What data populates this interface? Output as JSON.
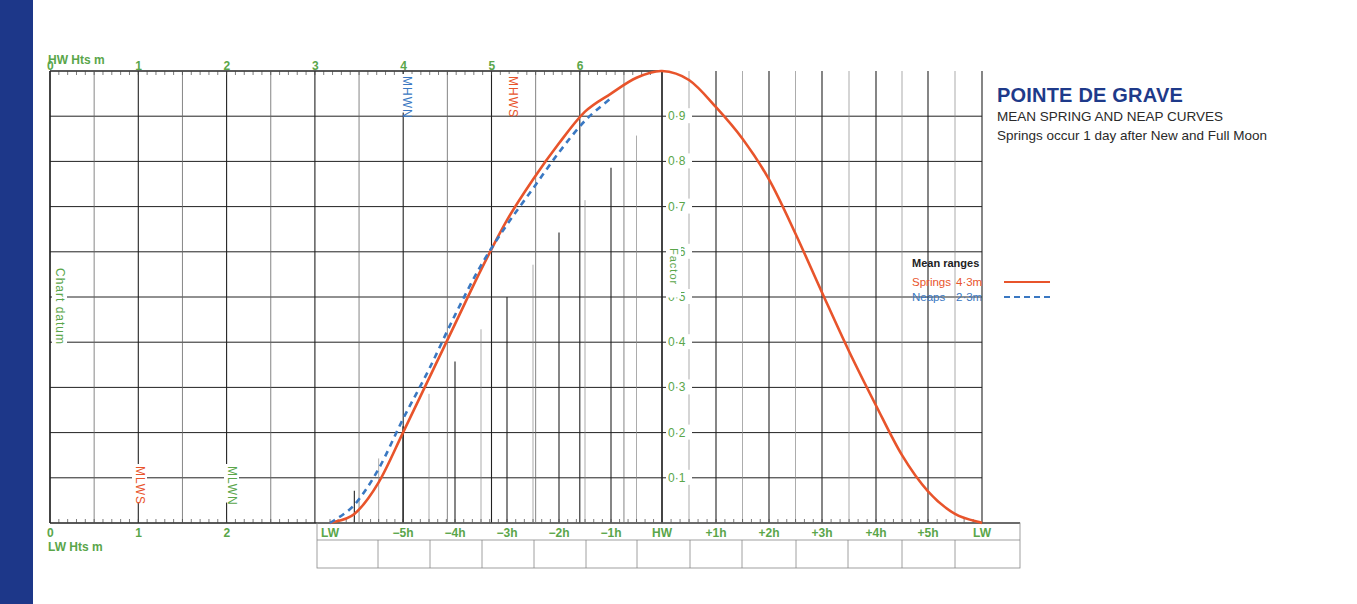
{
  "title": "POINTE DE GRAVE",
  "subtitle_lines": [
    "MEAN SPRING AND NEAP CURVES",
    "Springs occur 1 day after New and Full Moon"
  ],
  "legend": {
    "title": "Mean ranges",
    "items": [
      {
        "name": "Springs",
        "range": "4·3m",
        "style": "solid",
        "color": "#e8542b"
      },
      {
        "name": "Neaps",
        "range": "2·3m",
        "style": "dashed",
        "color": "#3a78c2"
      }
    ]
  },
  "axes": {
    "hw_heights_label": "HW Hts m",
    "lw_heights_label": "LW Hts m",
    "hw_height_ticks": [
      "0",
      "1",
      "2",
      "3",
      "4",
      "5",
      "6"
    ],
    "lw_height_ticks": [
      "0",
      "1",
      "2"
    ],
    "chart_datum_label": "Chart datum",
    "factor_label": "Factor",
    "factor_ticks": [
      "0·1",
      "0·2",
      "0·3",
      "0·4",
      "0·5",
      "0·6",
      "0·7",
      "0·8",
      "0·9"
    ],
    "time_ticks": [
      "LW",
      "−5h",
      "−4h",
      "−3h",
      "−2h",
      "−1h",
      "HW",
      "+1h",
      "+2h",
      "+3h",
      "+4h",
      "+5h",
      "LW"
    ]
  },
  "markers": {
    "mhwn": {
      "label": "MHWN",
      "color": "#3a78c2"
    },
    "mhws": {
      "label": "MHWS",
      "color": "#e8542b"
    },
    "mlws": {
      "label": "MLWS",
      "color": "#e8542b"
    },
    "mlwn": {
      "label": "MLWN",
      "color": "#5aa64a"
    }
  },
  "colors": {
    "accent_green": "#5aa64a",
    "springs": "#e8542b",
    "neaps": "#3a78c2",
    "title_blue": "#1e3a8a",
    "sidebar": "#1d3789"
  },
  "chart_data": {
    "type": "line",
    "xlabel": "Time relative to HW (h)",
    "ylabel": "Factor",
    "x": [
      -6.5,
      -6,
      -5.5,
      -5,
      -4.5,
      -4,
      -3.5,
      -3,
      -2.5,
      -2,
      -1.5,
      -1,
      -0.5,
      0,
      0.5,
      1,
      1.5,
      2,
      2.5,
      3,
      3.5,
      4,
      4.5,
      5,
      5.5,
      6
    ],
    "series": [
      {
        "name": "Springs (4·3m)",
        "values": [
          0.0,
          0.02,
          0.09,
          0.2,
          0.32,
          0.44,
          0.56,
          0.67,
          0.76,
          0.84,
          0.91,
          0.95,
          0.985,
          1.0,
          0.98,
          0.92,
          0.85,
          0.76,
          0.64,
          0.51,
          0.38,
          0.26,
          0.15,
          0.07,
          0.02,
          0.0
        ]
      },
      {
        "name": "Neaps (2·3m)",
        "values": [
          0.0,
          0.04,
          0.12,
          0.23,
          0.34,
          0.46,
          0.57,
          0.66,
          0.74,
          0.82,
          0.89,
          0.94,
          null,
          null,
          null,
          null,
          null,
          null,
          null,
          null,
          null,
          null,
          null,
          null,
          null,
          null
        ]
      }
    ],
    "xlim": [
      -6.5,
      6
    ],
    "ylim": [
      0,
      1
    ],
    "grid": true,
    "legend_position": "right",
    "hw_height_axis_m": [
      0,
      6.5
    ],
    "lw_height_axis_m": [
      0,
      3
    ],
    "annotations": [
      "MHWN",
      "MHWS",
      "MLWS",
      "MLWN",
      "Chart datum",
      "Factor"
    ]
  }
}
